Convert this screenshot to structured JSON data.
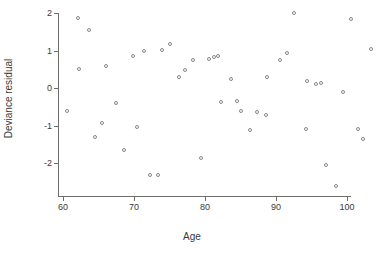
{
  "chart_data": {
    "type": "scatter",
    "title": "",
    "xlabel": "Age",
    "ylabel": "Deviance residual",
    "xlim": [
      58.5,
      104.0
    ],
    "ylim": [
      -2.85,
      2.15
    ],
    "xticks": [
      60,
      70,
      80,
      90,
      100
    ],
    "yticks": [
      2,
      1,
      0,
      -1,
      -2
    ],
    "xtick_labels": [
      "60",
      "70",
      "80",
      "90",
      "100"
    ],
    "ytick_labels": [
      "2",
      "1",
      "0",
      "-1",
      "-2"
    ],
    "grid": false,
    "legend": null,
    "marker": "open-circle",
    "marker_color": "#888888",
    "axis_color": "#6e6e6e",
    "background": "#ffffff",
    "n_points": 49,
    "points": [
      {
        "x": 60.6,
        "y": -0.61
      },
      {
        "x": 62.1,
        "y": 1.87
      },
      {
        "x": 63.6,
        "y": 1.55
      },
      {
        "x": 62.3,
        "y": 0.51
      },
      {
        "x": 64.5,
        "y": -1.3
      },
      {
        "x": 65.5,
        "y": -0.93
      },
      {
        "x": 66.0,
        "y": 0.58
      },
      {
        "x": 67.5,
        "y": -0.41
      },
      {
        "x": 68.6,
        "y": -1.65
      },
      {
        "x": 69.9,
        "y": 0.85
      },
      {
        "x": 70.4,
        "y": -1.03
      },
      {
        "x": 71.4,
        "y": 0.98
      },
      {
        "x": 72.3,
        "y": -2.33
      },
      {
        "x": 73.4,
        "y": -2.33
      },
      {
        "x": 73.9,
        "y": 1.01
      },
      {
        "x": 75.1,
        "y": 1.18
      },
      {
        "x": 76.4,
        "y": 0.3
      },
      {
        "x": 77.2,
        "y": 0.48
      },
      {
        "x": 78.3,
        "y": 0.75
      },
      {
        "x": 79.5,
        "y": -1.86
      },
      {
        "x": 80.5,
        "y": 0.78
      },
      {
        "x": 81.3,
        "y": 0.83
      },
      {
        "x": 81.9,
        "y": 0.86
      },
      {
        "x": 82.2,
        "y": -0.38
      },
      {
        "x": 83.6,
        "y": 0.25
      },
      {
        "x": 84.5,
        "y": -0.35
      },
      {
        "x": 85.0,
        "y": -0.62
      },
      {
        "x": 86.3,
        "y": -1.12
      },
      {
        "x": 87.3,
        "y": -0.64
      },
      {
        "x": 88.6,
        "y": -0.72
      },
      {
        "x": 88.8,
        "y": 0.3
      },
      {
        "x": 90.6,
        "y": 0.75
      },
      {
        "x": 91.5,
        "y": 0.94
      },
      {
        "x": 92.5,
        "y": 2.0
      },
      {
        "x": 94.2,
        "y": -1.1
      },
      {
        "x": 94.4,
        "y": 0.19
      },
      {
        "x": 95.6,
        "y": 0.12
      },
      {
        "x": 96.4,
        "y": 0.13
      },
      {
        "x": 97.0,
        "y": -2.05
      },
      {
        "x": 98.5,
        "y": -2.61
      },
      {
        "x": 99.5,
        "y": -0.1
      },
      {
        "x": 100.6,
        "y": 1.85
      },
      {
        "x": 101.6,
        "y": -1.1
      },
      {
        "x": 102.3,
        "y": -1.37
      },
      {
        "x": 103.4,
        "y": 1.05
      }
    ]
  }
}
